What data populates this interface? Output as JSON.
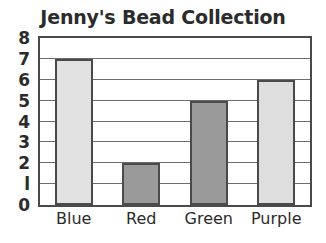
{
  "chart_data": {
    "type": "bar",
    "title": "Jenny's Bead Collection",
    "xlabel": "",
    "ylabel": "",
    "categories": [
      "Blue",
      "Red",
      "Green",
      "Purple"
    ],
    "values": [
      7,
      2,
      5,
      6
    ],
    "ylim": [
      0,
      8
    ],
    "ytick_labels": [
      "0",
      "l",
      "2",
      "3",
      "4",
      "5",
      "6",
      "7",
      "8"
    ],
    "ytick_values": [
      0,
      1,
      2,
      3,
      4,
      5,
      6,
      7,
      8
    ],
    "grid": "horizontal",
    "legend": "none",
    "bar_fills": [
      "#e2e2e2",
      "#9a9a9a",
      "#9a9a9a",
      "#dedede"
    ],
    "bar_border_color": "#4a4a4a",
    "frame_color": "#4a4a4a",
    "gridline_color": "#6d6d6d",
    "text_color": "#2b2b2b",
    "background": "#ffffff"
  }
}
